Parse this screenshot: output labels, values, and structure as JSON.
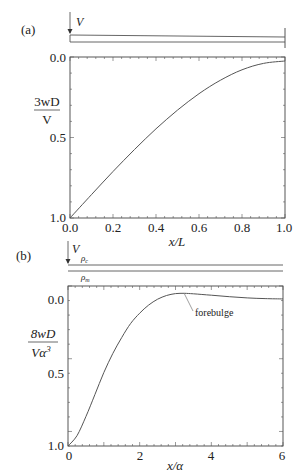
{
  "figure": {
    "panel_a": {
      "label": "(a)",
      "load_label": "V",
      "y_label_top": "3wD",
      "y_label_bottom": "V",
      "x_label": "x/L",
      "x_ticks": [
        "0.0",
        "0.2",
        "0.4",
        "0.6",
        "0.8",
        "1.0"
      ],
      "y_ticks": [
        "0.0",
        "0.5",
        "1.0"
      ]
    },
    "panel_b": {
      "label": "(b)",
      "load_label": "V",
      "rho_c_label": "ρ",
      "rho_c_sub": "c",
      "rho_m_label": "ρ",
      "rho_m_sub": "m",
      "y_label_top": "8wD",
      "y_label_bottom": "Vα",
      "y_label_sup": "3",
      "x_label": "x/α",
      "x_ticks": [
        "0",
        "2",
        "4",
        "6"
      ],
      "y_ticks": [
        "0.0",
        "0.5",
        "1.0"
      ],
      "annotation": "forebulge"
    },
    "line_color": "#555555",
    "axis_color": "#444444"
  },
  "chart_data": [
    {
      "type": "line",
      "title": "(a)",
      "xlabel": "x/L",
      "ylabel": "3wD/V",
      "xlim": [
        0,
        1
      ],
      "ylim": [
        1.0,
        0.0
      ],
      "y_inverted": true,
      "grid": false,
      "x": [
        0.0,
        0.1,
        0.2,
        0.3,
        0.4,
        0.5,
        0.6,
        0.7,
        0.8,
        0.9,
        1.0
      ],
      "series": [
        {
          "name": "deflection",
          "values": [
            1.0,
            0.851,
            0.704,
            0.564,
            0.432,
            0.313,
            0.208,
            0.122,
            0.056,
            0.015,
            0.0
          ]
        }
      ]
    },
    {
      "type": "line",
      "title": "(b)",
      "xlabel": "x/α",
      "ylabel": "8wD/Vα³",
      "xlim": [
        0,
        6
      ],
      "ylim": [
        1.0,
        -0.09
      ],
      "y_inverted": true,
      "grid": false,
      "x": [
        0.0,
        0.25,
        0.5,
        0.75,
        1.0,
        1.25,
        1.5,
        1.75,
        2.0,
        2.25,
        2.5,
        2.75,
        3.0,
        3.25,
        3.5,
        4.0,
        4.5,
        5.0,
        5.5,
        6.0
      ],
      "series": [
        {
          "name": "deflection",
          "values": [
            1.0,
            0.93,
            0.8,
            0.65,
            0.5,
            0.37,
            0.26,
            0.165,
            0.095,
            0.04,
            0.0,
            -0.025,
            -0.038,
            -0.04,
            -0.037,
            -0.027,
            -0.017,
            -0.009,
            -0.004,
            -0.002
          ]
        }
      ],
      "annotations": [
        {
          "text": "forebulge",
          "x": 3.1,
          "y": -0.04
        }
      ]
    }
  ]
}
